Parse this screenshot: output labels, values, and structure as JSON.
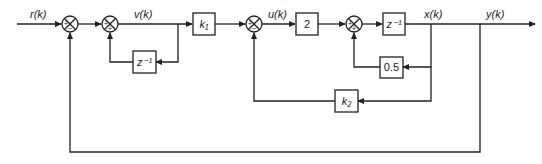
{
  "diagram": {
    "type": "block-diagram",
    "signals": {
      "input": "r(k)",
      "v": "v(k)",
      "u": "u(k)",
      "x": "x(k)",
      "output": "y(k)"
    },
    "blocks": {
      "delay1": "z⁻¹",
      "gain_k1": "k₁",
      "gain_2": "2",
      "delay2": "z⁻¹",
      "gain_05": "0.5",
      "gain_k2": "k₂"
    },
    "summing_junctions": [
      {
        "id": "sum1",
        "top": "+",
        "bottom": "−"
      },
      {
        "id": "sum2",
        "left": "+",
        "bottom": "+"
      },
      {
        "id": "sum3",
        "left": "+",
        "bottom": "−"
      },
      {
        "id": "sum4",
        "left": "+",
        "bottom": "+"
      }
    ],
    "colors": {
      "line": "#222222",
      "background": "#ffffff"
    }
  }
}
